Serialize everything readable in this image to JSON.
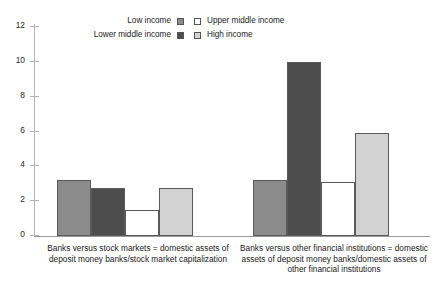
{
  "chart_data": {
    "type": "bar",
    "title": "",
    "subtitle": "",
    "xlabel": "",
    "ylabel": "",
    "ylim": [
      0,
      12
    ],
    "ytick_values": [
      12,
      10,
      8,
      6,
      4,
      2,
      0
    ],
    "ytick_labels": [
      "12",
      "10",
      "8",
      "6",
      "4",
      "2",
      "0"
    ],
    "grid": false,
    "legend_position": "top-center",
    "categories": [
      "Banks versus stock markets = domestic assets of deposit money banks/stock market capitalization",
      "Banks versus other financial institutions = domestic assets of deposit money banks/domestic assets of other financial institutions"
    ],
    "series": [
      {
        "name": "Low income",
        "color": "#8c8c8c",
        "values": [
          3.2,
          3.2
        ]
      },
      {
        "name": "Lower middle income",
        "color": "#4d4d4d",
        "values": [
          2.75,
          10.0
        ]
      },
      {
        "name": "Upper middle income",
        "color": "#ffffff",
        "values": [
          1.5,
          3.1
        ]
      },
      {
        "name": "High income",
        "color": "#d2d2d2",
        "values": [
          2.75,
          5.9
        ]
      }
    ]
  },
  "legend": {
    "left_column": [
      {
        "label": "Low income",
        "swatch_color": "#8c8c8c",
        "swatch_name": "legend-swatch-low-income"
      },
      {
        "label": "Lower middle income",
        "swatch_color": "#4d4d4d",
        "swatch_name": "legend-swatch-lower-middle-income"
      }
    ],
    "right_column": [
      {
        "label": "Upper middle income",
        "swatch_color": "#ffffff",
        "swatch_name": "legend-swatch-upper-middle-income"
      },
      {
        "label": "High income",
        "swatch_color": "#d2d2d2",
        "swatch_name": "legend-swatch-high-income"
      }
    ]
  },
  "captions": {
    "group_one": "Banks versus stock markets = domestic assets of deposit money banks/stock market capitalization",
    "group_two": "Banks versus other financial institutions = domestic assets of deposit money banks/domestic assets of other financial institutions"
  },
  "axis": {
    "labels": [
      "12",
      "10",
      "8",
      "6",
      "4",
      "2",
      "0"
    ]
  }
}
